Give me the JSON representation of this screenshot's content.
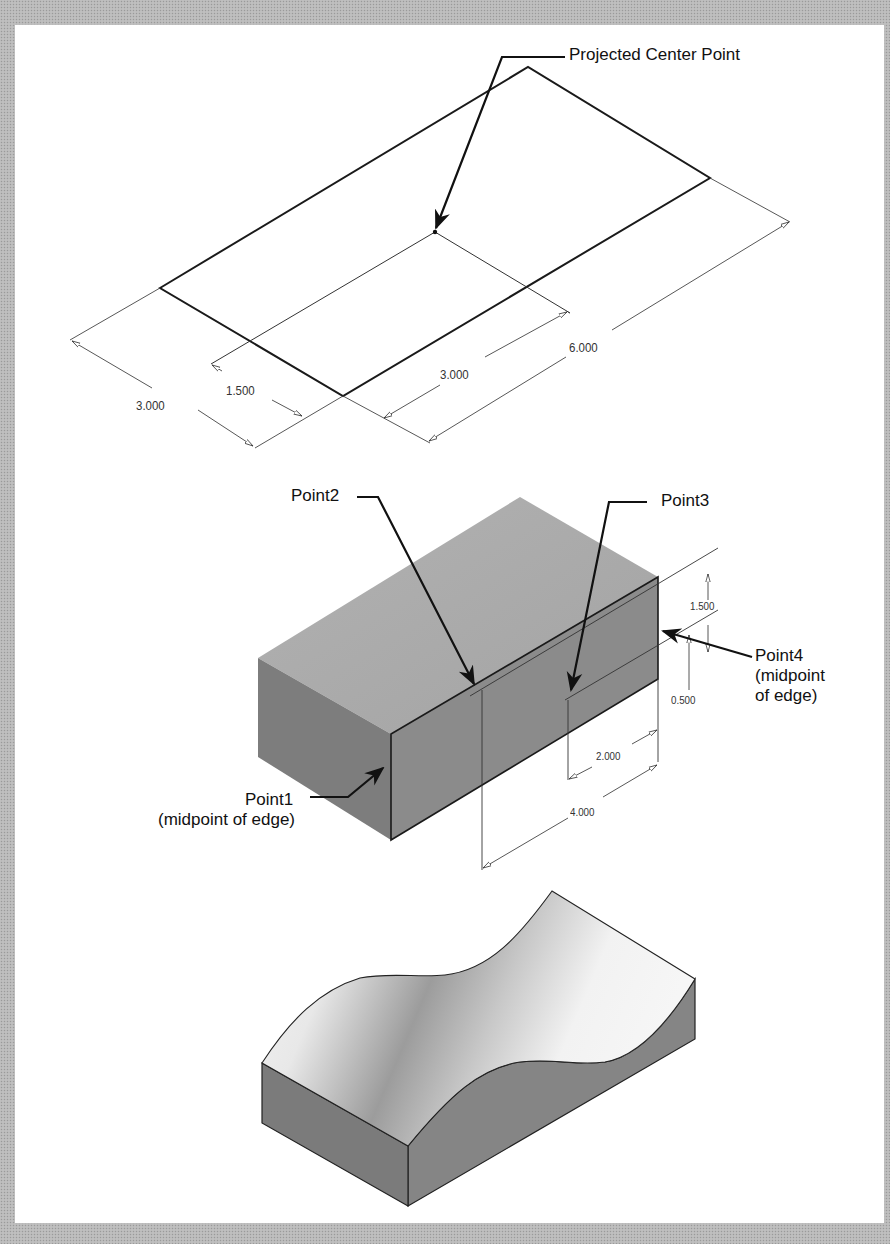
{
  "figure_1": {
    "title": "Sketch with projected center point",
    "callouts": {
      "projected_center_point": "Projected Center Point"
    },
    "dimensions": {
      "left_width": "3.000",
      "center_offset": "1.500",
      "inner_length": "3.000",
      "overall_length": "6.000"
    }
  },
  "figure_2": {
    "title": "Shaded block with reference points",
    "callouts": {
      "point1": "Point1",
      "point1_note": "(midpoint of edge)",
      "point2": "Point2",
      "point3": "Point3",
      "point4": "Point4",
      "point4_note_line1": "(midpoint",
      "point4_note_line2": "of edge)"
    },
    "dimensions": {
      "height_upper": "1.500",
      "height_lower": "0.500",
      "length_inner": "2.000",
      "length_outer": "4.000"
    }
  },
  "figure_3": {
    "title": "Block with wavy (spline) top surface"
  },
  "colors": {
    "page_border": "#b9b9b9",
    "panel": "#ffffff",
    "line": "#1a1a1a",
    "block_top": "#a9a9a9",
    "block_left": "#7c7c7c",
    "block_front": "#8a8a8a"
  }
}
